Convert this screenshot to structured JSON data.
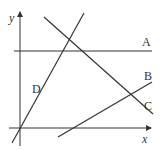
{
  "diagram": {
    "axes": {
      "x_label": "x",
      "y_label": "y"
    },
    "lines": [
      {
        "label": "A",
        "x1": 14,
        "y1": 51,
        "x2": 152,
        "y2": 51
      },
      {
        "label": "B",
        "x1": 58,
        "y1": 137,
        "x2": 152,
        "y2": 82
      },
      {
        "label": "C",
        "x1": 44,
        "y1": 17,
        "x2": 153,
        "y2": 114
      },
      {
        "label": "D",
        "x1": 12,
        "y1": 143,
        "x2": 84,
        "y2": 13
      }
    ],
    "colors": {
      "line": "#333333",
      "background": "#ffffff"
    }
  }
}
